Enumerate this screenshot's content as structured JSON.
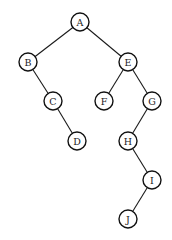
{
  "diagram": {
    "type": "binary-tree",
    "node_radius": 9,
    "nodes": [
      {
        "id": "A",
        "label": "A",
        "x": 80,
        "y": 22
      },
      {
        "id": "B",
        "label": "B",
        "x": 28,
        "y": 62
      },
      {
        "id": "E",
        "label": "E",
        "x": 128,
        "y": 62
      },
      {
        "id": "C",
        "label": "C",
        "x": 53,
        "y": 101
      },
      {
        "id": "F",
        "label": "F",
        "x": 104,
        "y": 101
      },
      {
        "id": "G",
        "label": "G",
        "x": 152,
        "y": 101
      },
      {
        "id": "D",
        "label": "D",
        "x": 77,
        "y": 141
      },
      {
        "id": "H",
        "label": "H",
        "x": 128,
        "y": 141
      },
      {
        "id": "I",
        "label": "I",
        "x": 152,
        "y": 180
      },
      {
        "id": "J",
        "label": "J",
        "x": 128,
        "y": 219
      }
    ],
    "edges": [
      {
        "from": "A",
        "to": "B"
      },
      {
        "from": "A",
        "to": "E"
      },
      {
        "from": "B",
        "to": "C"
      },
      {
        "from": "C",
        "to": "D"
      },
      {
        "from": "E",
        "to": "F"
      },
      {
        "from": "E",
        "to": "G"
      },
      {
        "from": "G",
        "to": "H"
      },
      {
        "from": "H",
        "to": "I"
      },
      {
        "from": "I",
        "to": "J"
      }
    ]
  }
}
